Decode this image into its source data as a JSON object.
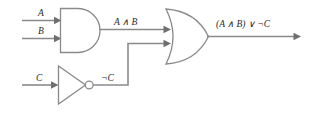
{
  "diagram": {
    "background_color": "#ffffff",
    "wire_color": "#8a8a8a",
    "label_color": "#2b2b2b",
    "inputs": [
      {
        "id": "a",
        "label": "A"
      },
      {
        "id": "b",
        "label": "B"
      },
      {
        "id": "c",
        "label": "C"
      }
    ],
    "gates": [
      {
        "id": "and-gate",
        "type": "AND",
        "symbol_name": "and-gate-symbol"
      },
      {
        "id": "or-gate",
        "type": "OR",
        "symbol_name": "or-gate-symbol"
      },
      {
        "id": "not-gate",
        "type": "NOT",
        "symbol_name": "not-gate-symbol"
      }
    ],
    "wire_labels": [
      {
        "id": "and-out",
        "label": "A ∧ B"
      },
      {
        "id": "not-out",
        "label": "¬C"
      }
    ],
    "output": {
      "id": "circuit-output",
      "label": "(A ∧ B) ∨ ¬C"
    }
  }
}
